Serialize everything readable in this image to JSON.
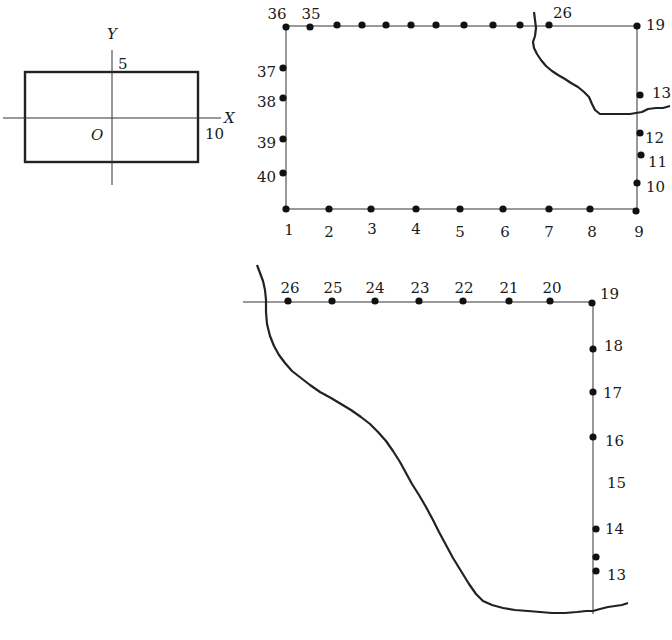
{
  "axes_diagram": {
    "x_axis_label": "X",
    "y_axis_label": "Y",
    "origin_label": "O",
    "y_tick_label": "5",
    "x_tick_label": "10"
  },
  "top_diagram": {
    "points": [
      {
        "id": "1",
        "label": "1",
        "x": 286,
        "y": 209,
        "lx": 289,
        "ly": 231,
        "anchor": "middle"
      },
      {
        "id": "2",
        "label": "2",
        "x": 329,
        "y": 209,
        "lx": 329,
        "ly": 233,
        "anchor": "middle"
      },
      {
        "id": "3",
        "label": "3",
        "x": 371,
        "y": 209,
        "lx": 372,
        "ly": 230,
        "anchor": "middle"
      },
      {
        "id": "4",
        "label": "4",
        "x": 416,
        "y": 209,
        "lx": 416,
        "ly": 230,
        "anchor": "middle"
      },
      {
        "id": "5",
        "label": "5",
        "x": 460,
        "y": 209,
        "lx": 460,
        "ly": 233,
        "anchor": "middle"
      },
      {
        "id": "6",
        "label": "6",
        "x": 503,
        "y": 209,
        "lx": 505,
        "ly": 233,
        "anchor": "middle"
      },
      {
        "id": "7",
        "label": "7",
        "x": 549,
        "y": 209,
        "lx": 549,
        "ly": 233,
        "anchor": "middle"
      },
      {
        "id": "8",
        "label": "8",
        "x": 590,
        "y": 209,
        "lx": 592,
        "ly": 233,
        "anchor": "middle"
      },
      {
        "id": "9",
        "label": "9",
        "x": 636,
        "y": 211,
        "lx": 639,
        "ly": 233,
        "anchor": "middle"
      },
      {
        "id": "10",
        "label": "10",
        "x": 637,
        "y": 183,
        "lx": 646,
        "ly": 188,
        "anchor": "start"
      },
      {
        "id": "11",
        "label": "11",
        "x": 641,
        "y": 155,
        "lx": 648,
        "ly": 163,
        "anchor": "start"
      },
      {
        "id": "12",
        "label": "12",
        "x": 640,
        "y": 133,
        "lx": 645,
        "ly": 139,
        "anchor": "start"
      },
      {
        "id": "13",
        "label": "13",
        "x": 640,
        "y": 95,
        "lx": 652,
        "ly": 94,
        "anchor": "start"
      },
      {
        "id": "19",
        "label": "19",
        "x": 637,
        "y": 26,
        "lx": 646,
        "ly": 26,
        "anchor": "start"
      },
      {
        "id": "26",
        "label": "26",
        "x": 549,
        "y": 25,
        "lx": 553,
        "ly": 14,
        "anchor": "start"
      },
      {
        "id": "27",
        "label": "",
        "x": 520,
        "y": 25
      },
      {
        "id": "28",
        "label": "",
        "x": 493,
        "y": 25
      },
      {
        "id": "29",
        "label": "",
        "x": 464,
        "y": 25
      },
      {
        "id": "30",
        "label": "",
        "x": 436,
        "y": 25
      },
      {
        "id": "31",
        "label": "",
        "x": 411,
        "y": 25
      },
      {
        "id": "32",
        "label": "",
        "x": 386,
        "y": 25
      },
      {
        "id": "33",
        "label": "",
        "x": 362,
        "y": 25
      },
      {
        "id": "34",
        "label": "",
        "x": 337,
        "y": 25
      },
      {
        "id": "35",
        "label": "35",
        "x": 310,
        "y": 27,
        "lx": 311,
        "ly": 15,
        "anchor": "middle"
      },
      {
        "id": "36",
        "label": "36",
        "x": 286,
        "y": 27,
        "lx": 277,
        "ly": 15,
        "anchor": "middle"
      },
      {
        "id": "37",
        "label": "37",
        "x": 283,
        "y": 68,
        "lx": 276,
        "ly": 73,
        "anchor": "end"
      },
      {
        "id": "38",
        "label": "38",
        "x": 283,
        "y": 98,
        "lx": 276,
        "ly": 103,
        "anchor": "end"
      },
      {
        "id": "39",
        "label": "39",
        "x": 283,
        "y": 139,
        "lx": 276,
        "ly": 144,
        "anchor": "end"
      },
      {
        "id": "40",
        "label": "40",
        "x": 283,
        "y": 173,
        "lx": 276,
        "ly": 178,
        "anchor": "end"
      }
    ]
  },
  "bottom_diagram": {
    "points": [
      {
        "id": "13",
        "label": "13",
        "x": 596,
        "y": 571,
        "lx": 607,
        "ly": 576,
        "anchor": "start"
      },
      {
        "id": "13b",
        "label": "",
        "x": 596,
        "y": 557
      },
      {
        "id": "14",
        "label": "14",
        "x": 596,
        "y": 529,
        "lx": 605,
        "ly": 530,
        "anchor": "start"
      },
      {
        "id": "15",
        "label": "15",
        "lx": 607,
        "ly": 484,
        "anchor": "start"
      },
      {
        "id": "16",
        "label": "16",
        "x": 593,
        "y": 437,
        "lx": 605,
        "ly": 442,
        "anchor": "start"
      },
      {
        "id": "17",
        "label": "17",
        "x": 593,
        "y": 392,
        "lx": 603,
        "ly": 394,
        "anchor": "start"
      },
      {
        "id": "18",
        "label": "18",
        "x": 593,
        "y": 349,
        "lx": 604,
        "ly": 347,
        "anchor": "start"
      },
      {
        "id": "19",
        "label": "19",
        "x": 592,
        "y": 303,
        "lx": 600,
        "ly": 295,
        "anchor": "start"
      },
      {
        "id": "20",
        "label": "20",
        "x": 550,
        "y": 301,
        "lx": 552,
        "ly": 289,
        "anchor": "middle"
      },
      {
        "id": "21",
        "label": "21",
        "x": 509,
        "y": 301,
        "lx": 509,
        "ly": 289,
        "anchor": "middle"
      },
      {
        "id": "22",
        "label": "22",
        "x": 463,
        "y": 301,
        "lx": 464,
        "ly": 289,
        "anchor": "middle"
      },
      {
        "id": "23",
        "label": "23",
        "x": 419,
        "y": 301,
        "lx": 420,
        "ly": 289,
        "anchor": "middle"
      },
      {
        "id": "24",
        "label": "24",
        "x": 375,
        "y": 301,
        "lx": 375,
        "ly": 289,
        "anchor": "middle"
      },
      {
        "id": "25",
        "label": "25",
        "x": 332,
        "y": 301,
        "lx": 333,
        "ly": 289,
        "anchor": "middle"
      },
      {
        "id": "26",
        "label": "26",
        "x": 288,
        "y": 301,
        "lx": 290,
        "ly": 289,
        "anchor": "middle"
      }
    ]
  }
}
